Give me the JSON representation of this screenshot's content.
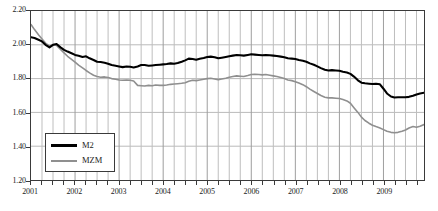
{
  "chart_data": {
    "type": "line",
    "title": "",
    "subtitle": "",
    "xlabel": "",
    "ylabel": "",
    "xlim": [
      2001.0,
      2009.92
    ],
    "ylim": [
      1.2,
      2.2
    ],
    "yticks": [
      "2.20",
      "2.00",
      "1.80",
      "1.60",
      "1.40",
      "1.20"
    ],
    "ytick_values": [
      2.2,
      2.0,
      1.8,
      1.6,
      1.4,
      1.2
    ],
    "xticks": [
      "2001",
      "2002",
      "2003",
      "2004",
      "2005",
      "2006",
      "2007",
      "2008",
      "2009"
    ],
    "xtick_values": [
      2001,
      2002,
      2003,
      2004,
      2005,
      2006,
      2007,
      2008,
      2009
    ],
    "grid": true,
    "grid_x": "quarterly",
    "grid_y": "major",
    "legend_position": "lower-left",
    "legend": [
      "M2",
      "MZM"
    ],
    "colors": {
      "M2": "#000000",
      "MZM": "#8f8f8f"
    },
    "x": [
      2001.0,
      2001.08,
      2001.17,
      2001.25,
      2001.33,
      2001.42,
      2001.5,
      2001.58,
      2001.67,
      2001.75,
      2001.83,
      2001.92,
      2002.0,
      2002.08,
      2002.17,
      2002.25,
      2002.33,
      2002.42,
      2002.5,
      2002.58,
      2002.67,
      2002.75,
      2002.83,
      2002.92,
      2003.0,
      2003.08,
      2003.17,
      2003.25,
      2003.33,
      2003.42,
      2003.5,
      2003.58,
      2003.67,
      2003.75,
      2003.83,
      2003.92,
      2004.0,
      2004.08,
      2004.17,
      2004.25,
      2004.33,
      2004.42,
      2004.5,
      2004.58,
      2004.67,
      2004.75,
      2004.83,
      2004.92,
      2005.0,
      2005.08,
      2005.17,
      2005.25,
      2005.33,
      2005.42,
      2005.5,
      2005.58,
      2005.67,
      2005.75,
      2005.83,
      2005.92,
      2006.0,
      2006.08,
      2006.17,
      2006.25,
      2006.33,
      2006.42,
      2006.5,
      2006.58,
      2006.67,
      2006.75,
      2006.83,
      2006.92,
      2007.0,
      2007.08,
      2007.17,
      2007.25,
      2007.33,
      2007.42,
      2007.5,
      2007.58,
      2007.67,
      2007.75,
      2007.83,
      2007.92,
      2008.0,
      2008.08,
      2008.17,
      2008.25,
      2008.33,
      2008.42,
      2008.5,
      2008.58,
      2008.67,
      2008.75,
      2008.83,
      2008.92,
      2009.0,
      2009.08,
      2009.17,
      2009.25,
      2009.33,
      2009.42,
      2009.5,
      2009.58,
      2009.67,
      2009.75,
      2009.83,
      2009.92
    ],
    "series": [
      {
        "name": "M2",
        "color": "#000000",
        "values": [
          2.045,
          2.04,
          2.03,
          2.02,
          2.0,
          1.985,
          2.0,
          2.005,
          1.985,
          1.97,
          1.96,
          1.95,
          1.94,
          1.935,
          1.928,
          1.932,
          1.92,
          1.91,
          1.9,
          1.898,
          1.894,
          1.888,
          1.88,
          1.876,
          1.872,
          1.868,
          1.872,
          1.87,
          1.866,
          1.872,
          1.88,
          1.88,
          1.876,
          1.878,
          1.88,
          1.882,
          1.884,
          1.886,
          1.89,
          1.888,
          1.892,
          1.9,
          1.908,
          1.918,
          1.916,
          1.912,
          1.918,
          1.922,
          1.928,
          1.93,
          1.926,
          1.92,
          1.924,
          1.928,
          1.932,
          1.936,
          1.94,
          1.938,
          1.936,
          1.94,
          1.944,
          1.942,
          1.94,
          1.938,
          1.94,
          1.938,
          1.936,
          1.934,
          1.93,
          1.926,
          1.92,
          1.918,
          1.916,
          1.91,
          1.906,
          1.9,
          1.89,
          1.882,
          1.872,
          1.862,
          1.852,
          1.848,
          1.85,
          1.848,
          1.846,
          1.84,
          1.836,
          1.828,
          1.812,
          1.79,
          1.776,
          1.772,
          1.77,
          1.768,
          1.77,
          1.766,
          1.74,
          1.712,
          1.694,
          1.688,
          1.69,
          1.69,
          1.69,
          1.692,
          1.698,
          1.706,
          1.712,
          1.716
        ]
      },
      {
        "name": "MZM",
        "color": "#8f8f8f",
        "values": [
          2.12,
          2.09,
          2.06,
          2.035,
          2.01,
          1.992,
          2.0,
          1.996,
          1.972,
          1.952,
          1.932,
          1.914,
          1.898,
          1.88,
          1.864,
          1.848,
          1.834,
          1.82,
          1.812,
          1.808,
          1.81,
          1.806,
          1.8,
          1.796,
          1.792,
          1.79,
          1.792,
          1.79,
          1.786,
          1.76,
          1.758,
          1.756,
          1.76,
          1.758,
          1.762,
          1.76,
          1.76,
          1.762,
          1.766,
          1.768,
          1.77,
          1.772,
          1.776,
          1.784,
          1.79,
          1.788,
          1.792,
          1.796,
          1.8,
          1.802,
          1.798,
          1.794,
          1.798,
          1.802,
          1.808,
          1.812,
          1.816,
          1.814,
          1.812,
          1.818,
          1.824,
          1.826,
          1.824,
          1.822,
          1.824,
          1.82,
          1.816,
          1.812,
          1.806,
          1.8,
          1.792,
          1.788,
          1.782,
          1.774,
          1.764,
          1.752,
          1.738,
          1.724,
          1.712,
          1.7,
          1.69,
          1.686,
          1.686,
          1.684,
          1.682,
          1.676,
          1.668,
          1.654,
          1.628,
          1.6,
          1.572,
          1.552,
          1.536,
          1.524,
          1.516,
          1.508,
          1.498,
          1.488,
          1.482,
          1.48,
          1.482,
          1.488,
          1.496,
          1.508,
          1.516,
          1.512,
          1.518,
          1.528
        ]
      }
    ]
  }
}
